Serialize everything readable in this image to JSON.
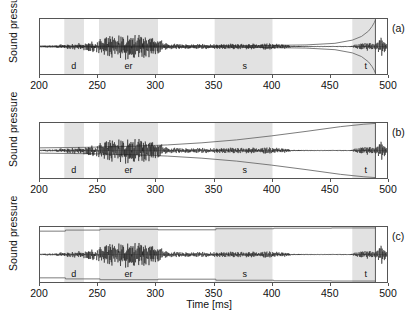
{
  "figure": {
    "xlabel": "Time [ms]",
    "ylabel": "Sound pressure",
    "panels": [
      {
        "tag": "(a)",
        "id": "a"
      },
      {
        "tag": "(b)",
        "id": "b"
      },
      {
        "tag": "(c)",
        "id": "c"
      }
    ]
  },
  "chart_data": {
    "type": "line",
    "title": "",
    "xlabel": "Time [ms]",
    "ylabel": "Sound pressure",
    "xlim": [
      200,
      500
    ],
    "ylim": [
      -1,
      1
    ],
    "grid": false,
    "legend": null,
    "xticks": [
      200,
      250,
      300,
      350,
      400,
      450,
      500
    ],
    "xticklabels": [
      "200",
      "250",
      "300",
      "350",
      "400",
      "450",
      "500"
    ],
    "yticks": [],
    "yticklabels": [],
    "segments": [
      {
        "label": "d",
        "start": 221,
        "end": 238,
        "center": 229
      },
      {
        "label": "er",
        "start": 251,
        "end": 302,
        "center": 276
      },
      {
        "label": "s",
        "start": 351,
        "end": 401,
        "center": 376
      },
      {
        "label": "t",
        "start": 470,
        "end": 490,
        "center": 480
      }
    ],
    "shading_color": "#e2e2e2",
    "waveform_color": "#1a1a1a",
    "envelope_color": "#6a6a6a",
    "marker_line_time": 490,
    "panels": [
      {
        "tag": "(a)",
        "type": "line",
        "description": "speech waveform with reversed-exponential envelope converging at 490 ms",
        "envelope": {
          "kind": "reverse-exponential",
          "x": [
            200,
            300,
            380,
            430,
            455,
            470,
            478,
            484,
            487,
            489,
            490
          ],
          "upper": [
            0.012,
            0.018,
            0.03,
            0.06,
            0.12,
            0.24,
            0.38,
            0.58,
            0.75,
            0.9,
            1.0
          ],
          "lower": [
            -0.012,
            -0.018,
            -0.03,
            -0.06,
            -0.12,
            -0.24,
            -0.38,
            -0.58,
            -0.75,
            -0.9,
            -1.0
          ]
        },
        "waveform_envelope": [
          {
            "t": 200,
            "a": 0.07
          },
          {
            "t": 212,
            "a": 0.07
          },
          {
            "t": 221,
            "a": 0.18
          },
          {
            "t": 232,
            "a": 0.26
          },
          {
            "t": 240,
            "a": 0.3
          },
          {
            "t": 250,
            "a": 0.52
          },
          {
            "t": 262,
            "a": 0.8
          },
          {
            "t": 272,
            "a": 0.92
          },
          {
            "t": 284,
            "a": 0.86
          },
          {
            "t": 295,
            "a": 0.78
          },
          {
            "t": 302,
            "a": 0.52
          },
          {
            "t": 312,
            "a": 0.22
          },
          {
            "t": 325,
            "a": 0.17
          },
          {
            "t": 345,
            "a": 0.18
          },
          {
            "t": 365,
            "a": 0.2
          },
          {
            "t": 385,
            "a": 0.22
          },
          {
            "t": 400,
            "a": 0.22
          },
          {
            "t": 412,
            "a": 0.16
          },
          {
            "t": 418,
            "a": 0.05
          },
          {
            "t": 440,
            "a": 0.02
          },
          {
            "t": 468,
            "a": 0.03
          },
          {
            "t": 476,
            "a": 0.22
          },
          {
            "t": 483,
            "a": 0.3
          },
          {
            "t": 489,
            "a": 0.18
          },
          {
            "t": 492,
            "a": 0.4
          },
          {
            "t": 495,
            "a": 0.7
          },
          {
            "t": 498,
            "a": 0.45
          },
          {
            "t": 500,
            "a": 0.12
          }
        ]
      },
      {
        "tag": "(b)",
        "type": "line",
        "description": "speech waveform with forward expanding exponential envelope truncated at 490 ms",
        "envelope": {
          "kind": "growing-exponential",
          "x": [
            200,
            240,
            280,
            310,
            340,
            370,
            400,
            430,
            460,
            480,
            490
          ],
          "upper": [
            0.1,
            0.12,
            0.16,
            0.21,
            0.29,
            0.4,
            0.55,
            0.72,
            0.9,
            0.99,
            1.02
          ],
          "lower": [
            -0.1,
            -0.12,
            -0.16,
            -0.21,
            -0.29,
            -0.4,
            -0.55,
            -0.72,
            -0.9,
            -0.99,
            -1.02
          ]
        },
        "waveform_envelope": [
          {
            "t": 200,
            "a": 0.07
          },
          {
            "t": 212,
            "a": 0.07
          },
          {
            "t": 221,
            "a": 0.18
          },
          {
            "t": 232,
            "a": 0.26
          },
          {
            "t": 240,
            "a": 0.3
          },
          {
            "t": 250,
            "a": 0.52
          },
          {
            "t": 262,
            "a": 0.8
          },
          {
            "t": 272,
            "a": 0.92
          },
          {
            "t": 284,
            "a": 0.86
          },
          {
            "t": 295,
            "a": 0.78
          },
          {
            "t": 302,
            "a": 0.52
          },
          {
            "t": 312,
            "a": 0.22
          },
          {
            "t": 325,
            "a": 0.17
          },
          {
            "t": 345,
            "a": 0.18
          },
          {
            "t": 365,
            "a": 0.2
          },
          {
            "t": 385,
            "a": 0.22
          },
          {
            "t": 400,
            "a": 0.22
          },
          {
            "t": 412,
            "a": 0.16
          },
          {
            "t": 418,
            "a": 0.05
          },
          {
            "t": 440,
            "a": 0.02
          },
          {
            "t": 468,
            "a": 0.03
          },
          {
            "t": 476,
            "a": 0.22
          },
          {
            "t": 483,
            "a": 0.3
          },
          {
            "t": 489,
            "a": 0.18
          },
          {
            "t": 492,
            "a": 0.4
          },
          {
            "t": 495,
            "a": 0.7
          },
          {
            "t": 498,
            "a": 0.45
          },
          {
            "t": 500,
            "a": 0.12
          }
        ]
      },
      {
        "tag": "(c)",
        "type": "line",
        "description": "speech waveform with piecewise-constant stepped envelope near full scale",
        "envelope": {
          "kind": "stepped",
          "steps": [
            {
              "start": 200,
              "end": 222,
              "value": 0.88
            },
            {
              "start": 222,
              "end": 252,
              "value": 0.92
            },
            {
              "start": 252,
              "end": 302,
              "value": 0.95
            },
            {
              "start": 302,
              "end": 352,
              "value": 0.93
            },
            {
              "start": 352,
              "end": 402,
              "value": 0.97
            },
            {
              "start": 402,
              "end": 452,
              "value": 0.99
            },
            {
              "start": 452,
              "end": 490,
              "value": 1.0
            }
          ]
        },
        "waveform_envelope": [
          {
            "t": 200,
            "a": 0.07
          },
          {
            "t": 212,
            "a": 0.07
          },
          {
            "t": 221,
            "a": 0.18
          },
          {
            "t": 232,
            "a": 0.26
          },
          {
            "t": 240,
            "a": 0.3
          },
          {
            "t": 250,
            "a": 0.52
          },
          {
            "t": 262,
            "a": 0.8
          },
          {
            "t": 272,
            "a": 0.92
          },
          {
            "t": 284,
            "a": 0.86
          },
          {
            "t": 295,
            "a": 0.78
          },
          {
            "t": 302,
            "a": 0.52
          },
          {
            "t": 312,
            "a": 0.22
          },
          {
            "t": 325,
            "a": 0.17
          },
          {
            "t": 345,
            "a": 0.18
          },
          {
            "t": 365,
            "a": 0.2
          },
          {
            "t": 385,
            "a": 0.22
          },
          {
            "t": 400,
            "a": 0.22
          },
          {
            "t": 412,
            "a": 0.16
          },
          {
            "t": 418,
            "a": 0.05
          },
          {
            "t": 440,
            "a": 0.02
          },
          {
            "t": 468,
            "a": 0.03
          },
          {
            "t": 476,
            "a": 0.22
          },
          {
            "t": 483,
            "a": 0.3
          },
          {
            "t": 489,
            "a": 0.18
          },
          {
            "t": 492,
            "a": 0.4
          },
          {
            "t": 495,
            "a": 0.7
          },
          {
            "t": 498,
            "a": 0.45
          },
          {
            "t": 500,
            "a": 0.12
          }
        ]
      }
    ]
  }
}
